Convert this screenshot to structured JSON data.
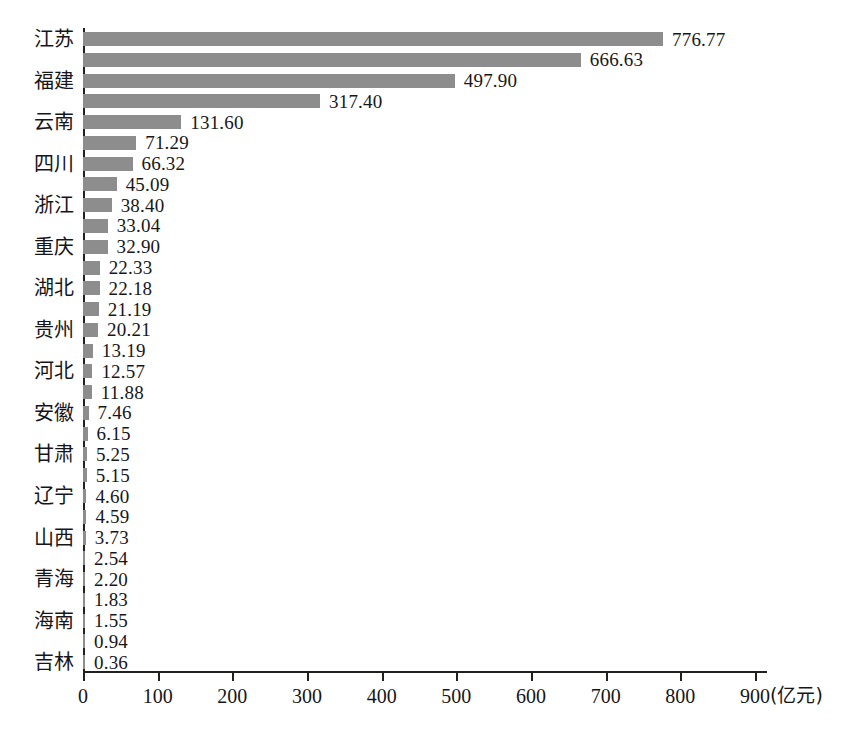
{
  "chart_data": {
    "type": "bar",
    "orientation": "horizontal",
    "title": "",
    "xlabel": "(亿元)",
    "ylabel": "",
    "xlim": [
      0,
      900
    ],
    "xticks": [
      0,
      100,
      200,
      300,
      400,
      500,
      600,
      700,
      800,
      900
    ],
    "grid": false,
    "legend": null,
    "bar_color": "#8d8d8d",
    "axis_color": "#20201f",
    "value_label_format": "0.00",
    "note": "Only alternating (odd-indexed) bars carry a visible province label on the axis.",
    "categories": [
      "江苏",
      "",
      "福建",
      "",
      "云南",
      "",
      "四川",
      "",
      "浙江",
      "",
      "重庆",
      "",
      "湖北",
      "",
      "贵州",
      "",
      "河北",
      "",
      "安徽",
      "",
      "甘肃",
      "",
      "辽宁",
      "",
      "山西",
      "",
      "青海",
      "",
      "海南",
      "",
      "吉林"
    ],
    "values": [
      776.77,
      666.63,
      497.9,
      317.4,
      131.6,
      71.29,
      66.32,
      45.09,
      38.4,
      33.04,
      32.9,
      22.33,
      22.18,
      21.19,
      20.21,
      13.19,
      12.57,
      11.88,
      7.46,
      6.15,
      5.25,
      5.15,
      4.6,
      4.59,
      3.73,
      2.54,
      2.2,
      1.83,
      1.55,
      0.94,
      0.36
    ],
    "labeled_categories": [
      "江苏",
      "福建",
      "云南",
      "四川",
      "浙江",
      "重庆",
      "湖北",
      "贵州",
      "河北",
      "安徽",
      "甘肃",
      "辽宁",
      "山西",
      "青海",
      "海南",
      "吉林"
    ]
  },
  "axis": {
    "unit": "(亿元)"
  },
  "caption": {
    "text": ""
  }
}
